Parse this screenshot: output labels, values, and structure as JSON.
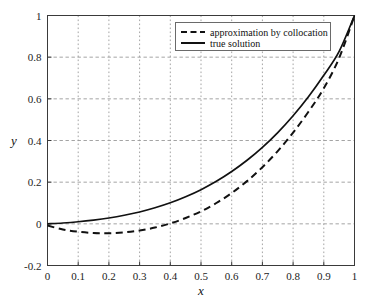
{
  "chart_data": {
    "type": "line",
    "title": "",
    "xlabel": "x",
    "ylabel": "y",
    "xlim": [
      0,
      1
    ],
    "ylim": [
      -0.2,
      1
    ],
    "grid": true,
    "legend_position": "top-right",
    "xticks": [
      0,
      0.1,
      0.2,
      0.3,
      0.4,
      0.5,
      0.6,
      0.7,
      0.8,
      0.9,
      1
    ],
    "xtick_labels": [
      "0",
      "0.1",
      "0.2",
      "0.3",
      "0.4",
      "0.5",
      "0.6",
      "0.7",
      "0.8",
      "0.9",
      "1"
    ],
    "yticks": [
      -0.2,
      0,
      0.2,
      0.4,
      0.6,
      0.8,
      1
    ],
    "ytick_labels": [
      "-0.2",
      "0",
      "0.2",
      "0.4",
      "0.6",
      "0.8",
      "1"
    ],
    "x": [
      0,
      0.05,
      0.1,
      0.15,
      0.2,
      0.25,
      0.3,
      0.35,
      0.4,
      0.45,
      0.5,
      0.55,
      0.6,
      0.65,
      0.7,
      0.75,
      0.8,
      0.85,
      0.9,
      0.95,
      1
    ],
    "series": [
      {
        "name": "approximation by collocation",
        "style": "dashed",
        "color": "#111111",
        "values": [
          -0.008,
          -0.027,
          -0.038,
          -0.044,
          -0.045,
          -0.041,
          -0.032,
          -0.018,
          0.002,
          0.028,
          0.06,
          0.1,
          0.148,
          0.205,
          0.272,
          0.349,
          0.438,
          0.538,
          0.651,
          0.796,
          1.0
        ]
      },
      {
        "name": "true solution",
        "style": "solid",
        "color": "#111111",
        "values": [
          0.0,
          0.004,
          0.01,
          0.018,
          0.028,
          0.041,
          0.057,
          0.077,
          0.101,
          0.13,
          0.164,
          0.204,
          0.251,
          0.305,
          0.367,
          0.438,
          0.519,
          0.61,
          0.713,
          0.828,
          1.0
        ]
      }
    ]
  },
  "legend": {
    "entries": [
      {
        "label": "approximation by collocation",
        "style": "dashed"
      },
      {
        "label": "true solution",
        "style": "solid"
      }
    ]
  },
  "axes": {
    "x_axis_label": "x",
    "y_axis_label": "y"
  },
  "colors": {
    "background": "#ffffff",
    "axis": "#3a3a3a",
    "grid": "#9a9a9a",
    "curve": "#111111",
    "legend_border": "#6a6a6a"
  }
}
